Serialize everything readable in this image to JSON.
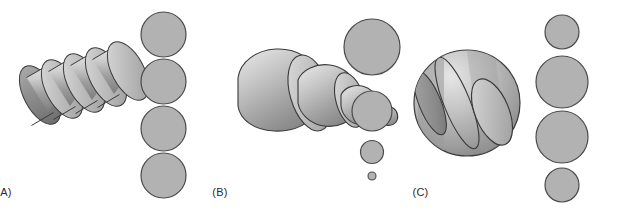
{
  "figure": {
    "background_color": "#ffffff",
    "width": 617,
    "height": 211
  },
  "style": {
    "section_fill": "#b2b2b2",
    "section_stroke": "#4a4a4a",
    "solid_light": "#d8d8d8",
    "solid_mid": "#b4b4b4",
    "solid_dark": "#8c8c8c",
    "solid_stroke": "#3a3a3a",
    "label_color": "#2b2b2b"
  },
  "panels": [
    {
      "id": "a",
      "label": "(A)",
      "solid": "cylinder",
      "solid_name": "sliced-cylinder",
      "slice_count": 4,
      "cross_sections": [
        {
          "index": 1,
          "diameter": 45
        },
        {
          "index": 2,
          "diameter": 45
        },
        {
          "index": 3,
          "diameter": 45
        },
        {
          "index": 4,
          "diameter": 45
        }
      ],
      "cross_section_pattern": "equal"
    },
    {
      "id": "b",
      "label": "(B)",
      "solid": "cone",
      "solid_name": "sliced-cone",
      "slice_count": 4,
      "cross_sections": [
        {
          "index": 1,
          "diameter": 56
        },
        {
          "index": 2,
          "diameter": 40
        },
        {
          "index": 3,
          "diameter": 23
        },
        {
          "index": 4,
          "diameter": 8
        }
      ],
      "cross_section_pattern": "decreasing"
    },
    {
      "id": "c",
      "label": "(C)",
      "solid": "sphere",
      "solid_name": "sliced-sphere",
      "slice_count": 4,
      "cross_sections": [
        {
          "index": 1,
          "diameter": 34
        },
        {
          "index": 2,
          "diameter": 52
        },
        {
          "index": 3,
          "diameter": 52
        },
        {
          "index": 4,
          "diameter": 34
        }
      ],
      "cross_section_pattern": "small-large-large-small"
    }
  ]
}
